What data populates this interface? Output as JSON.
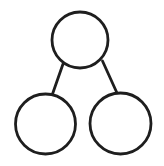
{
  "diagram": {
    "type": "tree",
    "background": "#ffffff",
    "stroke_color": "#1e1e1e",
    "stroke_width": 2.8,
    "nodes": [
      {
        "id": "root",
        "label": "",
        "cx": 80,
        "cy": 40,
        "r": 28
      },
      {
        "id": "left-child",
        "label": "",
        "cx": 45.5,
        "cy": 124,
        "r": 30
      },
      {
        "id": "right-child",
        "label": "",
        "cx": 120.5,
        "cy": 123.5,
        "r": 30.5
      }
    ],
    "edges": [
      {
        "from": "root",
        "to": "left-child",
        "x1": 63,
        "y1": 64,
        "x2": 52.5,
        "y2": 94
      },
      {
        "from": "root",
        "to": "right-child",
        "x1": 102.5,
        "y1": 61,
        "x2": 117,
        "y2": 93
      }
    ]
  }
}
